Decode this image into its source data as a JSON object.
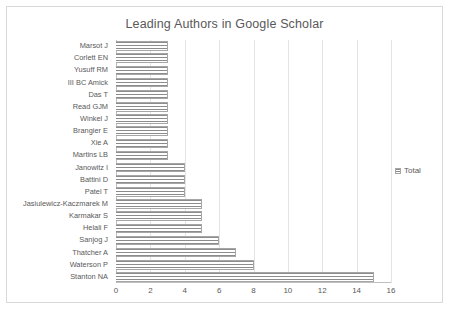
{
  "chart_data": {
    "type": "bar",
    "orientation": "horizontal",
    "title": "Leading Authors in Google Scholar",
    "xlabel": "",
    "ylabel": "",
    "xlim": [
      0,
      16
    ],
    "xticks": [
      "0",
      "2",
      "4",
      "6",
      "8",
      "10",
      "12",
      "14",
      "16"
    ],
    "grid": true,
    "legend": {
      "position": "right",
      "entries": [
        "Total"
      ]
    },
    "series": [
      {
        "name": "Total",
        "values": [
          3,
          3,
          3,
          3,
          3,
          3,
          3,
          3,
          3,
          3,
          4,
          4,
          4,
          5,
          5,
          5,
          6,
          7,
          8,
          15
        ]
      }
    ],
    "categories": [
      "Marsot J",
      "Corlett EN",
      "Yusuff RM",
      "III BC Amick",
      "Das T",
      "Read GJM",
      "Winkel J",
      "Brangier E",
      "Xie A",
      "Martins LB",
      "Janowitz I",
      "Battini D",
      "Patel T",
      "Jasiulewicz-Kaczmarek M",
      "Karmakar S",
      "Helali F",
      "Sanjog J",
      "Thatcher A",
      "Waterson P",
      "Stanton NA"
    ]
  },
  "colors": {
    "title_text": "#595959",
    "label_text": "#595959",
    "gridline": "#e4e4e4",
    "axis": "#bfbfbf",
    "bar_stripe": "#8c8c8c",
    "bar_border": "#a6a6a6",
    "frame_border": "#d9d9d9",
    "background": "#ffffff"
  }
}
